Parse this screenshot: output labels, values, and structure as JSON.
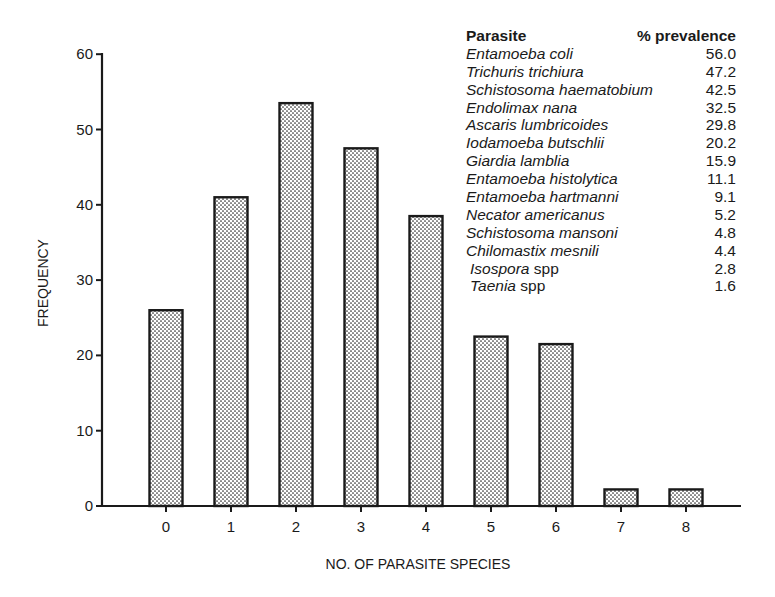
{
  "chart_data": {
    "type": "bar",
    "title": "",
    "xlabel": "NO. OF PARASITE SPECIES",
    "ylabel": "FREQUENCY",
    "categories": [
      "0",
      "1",
      "2",
      "3",
      "4",
      "5",
      "6",
      "7",
      "8"
    ],
    "values": [
      26,
      41,
      53.5,
      47.5,
      38.5,
      22.5,
      21.5,
      2.2,
      2.2
    ],
    "ylim": [
      0,
      60
    ],
    "yticks": [
      0,
      10,
      20,
      30,
      40,
      50,
      60
    ],
    "grid": false,
    "bar_fill": "dotted stipple pattern",
    "legend_table": {
      "position": "upper right",
      "header": {
        "name": "Parasite",
        "value": "% prevalence"
      },
      "rows": [
        {
          "name": "Entamoeba coli",
          "value": "56.0"
        },
        {
          "name": "Trichuris trichiura",
          "value": "47.2"
        },
        {
          "name": "Schistosoma haematobium",
          "value": "42.5"
        },
        {
          "name": "Endolimax nana",
          "value": "32.5"
        },
        {
          "name": "Ascaris lumbricoides",
          "value": "29.8"
        },
        {
          "name": "Iodamoeba butschlii",
          "value": "20.2"
        },
        {
          "name": "Giardia lamblia",
          "value": "15.9"
        },
        {
          "name": "Entamoeba histolytica",
          "value": "11.1"
        },
        {
          "name": "Entamoeba hartmanni",
          "value": "9.1"
        },
        {
          "name": "Necator americanus",
          "value": "5.2"
        },
        {
          "name": "Schistosoma mansoni",
          "value": "4.8"
        },
        {
          "name": "Chilomastix mesnili",
          "value": "4.4"
        },
        {
          "name": "Isospora",
          "suffix": " spp",
          "value": "2.8"
        },
        {
          "name": "Taenia",
          "suffix": " spp",
          "value": "1.6"
        }
      ]
    }
  },
  "colors": {
    "ink": "#1a1a1a",
    "background": "#ffffff",
    "bar_dot": "#2a2a2a"
  }
}
